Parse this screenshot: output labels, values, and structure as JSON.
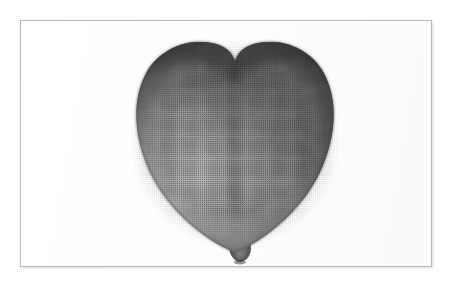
{
  "image": {
    "medium": "halftone-printed-photograph",
    "background_color": "#ffffff",
    "frame": {
      "border_color": "#b9b9b9",
      "fill_color": "#fefefe",
      "x": 20,
      "y": 20,
      "width": 412,
      "height": 247
    },
    "subject": {
      "name": "heart-shaped balloon",
      "shape": "heart",
      "orientation": "upright, two lobes at top, rounded point at bottom",
      "bounds": {
        "left": 120,
        "top": 32,
        "right": 348,
        "bottom": 248
      },
      "center_x": 234,
      "cleft": {
        "x": 235,
        "y": 75
      },
      "lobes": [
        {
          "side": "left",
          "peak_x": 172,
          "peak_y": 34
        },
        {
          "side": "right",
          "peak_x": 297,
          "peak_y": 33
        }
      ],
      "nozzle": {
        "name": "balloon-knot",
        "x": 236,
        "y": 245,
        "width": 16,
        "height": 18,
        "color": "#565656"
      },
      "tones": {
        "edge_dark": "#3d3d3d",
        "upper_shade": "#585858",
        "mid_tone": "#8b8b8b",
        "highlight": "#b0b0b0",
        "lower_shade": "#6e6e6e",
        "contour_seam": "#6a6a6a"
      },
      "texture": "halftone dot screen"
    }
  }
}
